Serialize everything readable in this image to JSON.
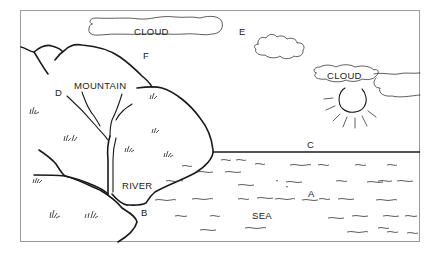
{
  "diagram": {
    "type": "landscape-water-cycle-illustration",
    "colors": {
      "ink": "#1a1a1a",
      "frame": "#999999",
      "background": "#ffffff"
    },
    "labels": {
      "cloud_top": "CLOUD",
      "cloud_right": "CLOUD",
      "mountain": "MOUNTAIN",
      "river": "RIVER",
      "sea": "SEA",
      "point_a": "A",
      "point_b": "B",
      "point_c": "C",
      "point_d": "D",
      "point_e": "E",
      "point_f": "F"
    },
    "elements": [
      "cloud",
      "cloud",
      "cloud",
      "sun",
      "mountain",
      "river",
      "sea",
      "grass",
      "horizon"
    ]
  }
}
